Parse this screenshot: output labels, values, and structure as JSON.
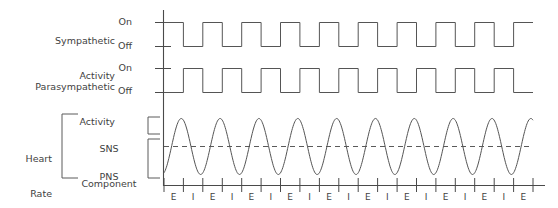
{
  "figure": {
    "background": "#ffffff",
    "line_color": "#555555",
    "text_color": "#3f3f3f"
  },
  "rows": {
    "sympathetic": {
      "label_line1": "Sympathetic",
      "label_line2": "Activity",
      "on_label": "On",
      "off_label": "Off"
    },
    "parasympathetic": {
      "label_line1": "Parasympathetic",
      "label_line2": "Activity",
      "on_label": "On",
      "off_label": "Off"
    },
    "heart_rate": {
      "label_line1": "Heart",
      "label_line2": "Rate",
      "sns_line1": "SNS",
      "sns_line2": "Component",
      "pns_line1": "PNS",
      "pns_line2": "Component"
    }
  },
  "axis": {
    "expiration_label": "E",
    "inspiration_label": "I",
    "sequence": [
      "E",
      "I",
      "E",
      "I",
      "E",
      "I",
      "E",
      "I",
      "E",
      "I",
      "E",
      "I",
      "E",
      "I",
      "E",
      "I",
      "E",
      "I",
      "E"
    ]
  },
  "chart_data": {
    "type": "line",
    "xlabel": "",
    "ylabel": "",
    "grid": false,
    "legend": "none",
    "x_axis": {
      "tick_labels": [
        "E",
        "I",
        "E",
        "I",
        "E",
        "I",
        "E",
        "I",
        "E",
        "I",
        "E",
        "I",
        "E",
        "I",
        "E",
        "I",
        "E",
        "I",
        "E"
      ],
      "note": "alternating expiration (E) and inspiration (I) phases",
      "range": [
        0,
        19
      ]
    },
    "series": [
      {
        "name": "Sympathetic Activity",
        "type": "square",
        "levels": [
          "Off",
          "On"
        ],
        "cycles": 9.5,
        "phase": "starts On at axis, high during inspiration",
        "values": [
          1,
          0,
          1,
          0,
          1,
          0,
          1,
          0,
          1,
          0,
          1,
          0,
          1,
          0,
          1,
          0,
          1,
          0,
          1
        ]
      },
      {
        "name": "Parasympathetic Activity",
        "type": "square",
        "levels": [
          "Off",
          "On"
        ],
        "cycles": 9.5,
        "phase": "antiphase to sympathetic, high during expiration",
        "values": [
          0,
          1,
          0,
          1,
          0,
          1,
          0,
          1,
          0,
          1,
          0,
          1,
          0,
          1,
          0,
          1,
          0,
          1,
          0
        ]
      },
      {
        "name": "Heart Rate",
        "type": "sine",
        "cycles": 9.5,
        "midline": "dashed baseline",
        "amplitude": 1,
        "note": "SNS component above midline, PNS component below midline"
      }
    ]
  }
}
